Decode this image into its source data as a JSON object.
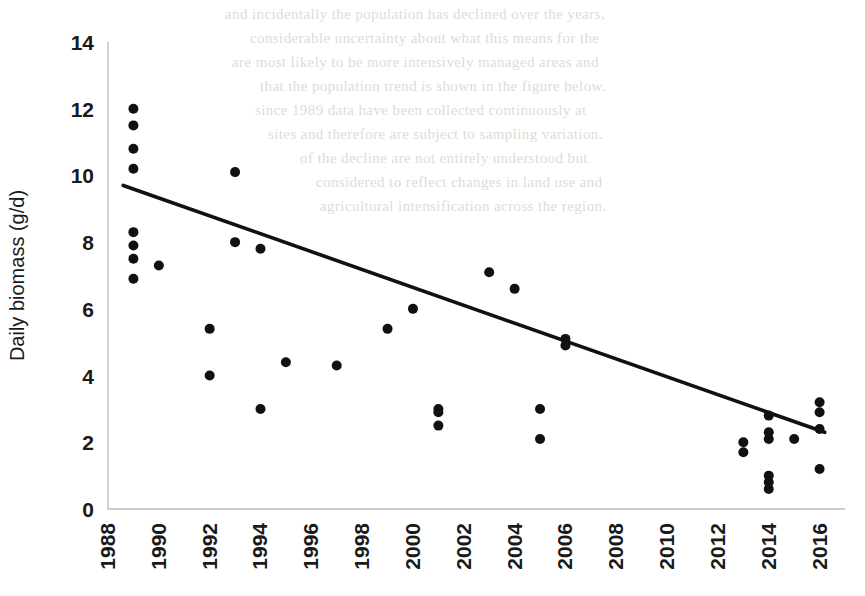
{
  "figure": {
    "title": "",
    "background_color": "#ffffff",
    "ink_color": "#111111",
    "axis_color": "#bfbfbf"
  },
  "scan_artifacts": {
    "visible": true,
    "lines": [
      "and incidentally the population has declined over the years,",
      "considerable uncertainty about what this means for the",
      "are most likely to be more intensively managed areas and",
      "that the population trend is shown in the figure below.",
      "since 1989 data have been collected continuously at",
      "sites and therefore are subject to sampling variation.",
      "of the decline are not entirely understood but",
      "considered to reflect changes in land use and",
      "agricultural intensification across the region."
    ]
  },
  "chart_data": {
    "type": "scatter",
    "title": "",
    "xlabel": "",
    "ylabel": "Daily biomass (g/d)",
    "xlim": [
      1988,
      2017
    ],
    "ylim": [
      0,
      14
    ],
    "xticks": [
      1988,
      1990,
      1992,
      1994,
      1996,
      1998,
      2000,
      2002,
      2004,
      2006,
      2008,
      2010,
      2012,
      2014,
      2016
    ],
    "xtick_labels": [
      "1988",
      "1990",
      "1992",
      "1994",
      "1996",
      "1998",
      "2000",
      "2002",
      "2004",
      "2006",
      "2008",
      "2010",
      "2012",
      "2014",
      "2016"
    ],
    "xtick_rotation": 90,
    "yticks": [
      0,
      2,
      4,
      6,
      8,
      10,
      12,
      14
    ],
    "ytick_labels": [
      "0",
      "2",
      "4",
      "6",
      "8",
      "10",
      "12",
      "14"
    ],
    "grid": false,
    "legend": false,
    "marker": "circle",
    "marker_size": 5,
    "series": [
      {
        "name": "Daily biomass",
        "points": [
          [
            1989,
            12.0
          ],
          [
            1989,
            11.5
          ],
          [
            1989,
            10.8
          ],
          [
            1989,
            10.2
          ],
          [
            1989,
            8.3
          ],
          [
            1989,
            7.9
          ],
          [
            1989,
            7.5
          ],
          [
            1989,
            6.9
          ],
          [
            1990,
            7.3
          ],
          [
            1992,
            5.4
          ],
          [
            1992,
            4.0
          ],
          [
            1993,
            10.1
          ],
          [
            1993,
            8.0
          ],
          [
            1994,
            7.8
          ],
          [
            1994,
            3.0
          ],
          [
            1995,
            4.4
          ],
          [
            1997,
            4.3
          ],
          [
            1999,
            5.4
          ],
          [
            2000,
            6.0
          ],
          [
            2001,
            3.0
          ],
          [
            2001,
            2.9
          ],
          [
            2001,
            2.5
          ],
          [
            2003,
            7.1
          ],
          [
            2004,
            6.6
          ],
          [
            2005,
            3.0
          ],
          [
            2005,
            2.1
          ],
          [
            2006,
            5.1
          ],
          [
            2006,
            4.9
          ],
          [
            2013,
            2.0
          ],
          [
            2013,
            1.7
          ],
          [
            2014,
            2.8
          ],
          [
            2014,
            2.3
          ],
          [
            2014,
            2.1
          ],
          [
            2014,
            1.0
          ],
          [
            2014,
            0.8
          ],
          [
            2014,
            0.6
          ],
          [
            2015,
            2.1
          ],
          [
            2016,
            3.2
          ],
          [
            2016,
            2.9
          ],
          [
            2016,
            2.4
          ],
          [
            2016,
            1.2
          ]
        ]
      }
    ],
    "trendline": {
      "name": "linear fit",
      "x_start": 1988.6,
      "y_start": 9.7,
      "x_end": 2016.2,
      "y_end": 2.3
    }
  }
}
